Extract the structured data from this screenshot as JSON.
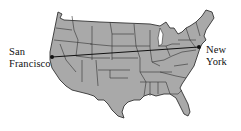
{
  "map": {
    "subject": "Contiguous United States with state borders",
    "fill_color": "#a9a9a9",
    "border_color": "#333333",
    "background_color": "#ffffff"
  },
  "cities": [
    {
      "name_line1": "San",
      "name_line2": "Francisco",
      "x": 52,
      "y": 57
    },
    {
      "name_line1": "New",
      "name_line2": "York",
      "x": 199,
      "y": 47
    }
  ],
  "route": {
    "from": "San Francisco",
    "to": "New York",
    "line_color": "#111111"
  }
}
